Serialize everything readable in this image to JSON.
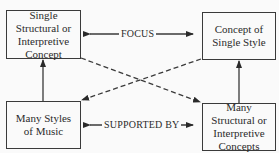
{
  "diagram": {
    "nodes": {
      "top_left": {
        "lines": [
          "Single",
          "Structural or",
          "Interpretive",
          "Concept"
        ]
      },
      "top_right": {
        "lines": [
          "Concept of",
          "Single Style"
        ]
      },
      "bottom_left": {
        "lines": [
          "Many Styles",
          "of Music"
        ]
      },
      "bottom_right": {
        "lines": [
          "Many",
          "Structural or",
          "Interpretive",
          "Concepts"
        ]
      }
    },
    "edges": {
      "top_label": "FOCUS",
      "bottom_label": "SUPPORTED BY"
    },
    "colors": {
      "line": "#3a3a3a",
      "background": "#fafafa"
    }
  }
}
